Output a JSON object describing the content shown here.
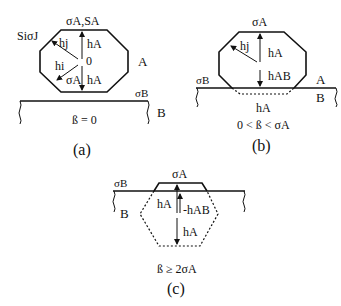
{
  "figure": {
    "panels": [
      {
        "id": "a",
        "caption": "(a)",
        "condition": "ß = 0",
        "labels": {
          "top": "σA,SA",
          "facet": "SiσJ",
          "hj": "hj",
          "hi": "hi",
          "origin": "0",
          "sigmaA_inner": "σA",
          "hA_up": "hA",
          "hA_down": "hA",
          "phaseA": "A",
          "sigmaB": "σB",
          "phaseB": "B"
        }
      },
      {
        "id": "b",
        "caption": "(b)",
        "condition": "0 < ß < σA",
        "labels": {
          "top": "σA",
          "hj": "hj",
          "hA_up": "hA",
          "hAB": "hAB",
          "sigmaB": "σB",
          "phaseA": "A",
          "phaseB": "B",
          "hA_below": "hA"
        }
      },
      {
        "id": "c",
        "caption": "(c)",
        "condition": "ß ≥ 2σA",
        "labels": {
          "top": "σA",
          "sigmaB": "σB",
          "phaseB": "B",
          "hA_left": "hA",
          "minus_hAB": "-hAB",
          "hA_down": "hA"
        }
      }
    ]
  }
}
